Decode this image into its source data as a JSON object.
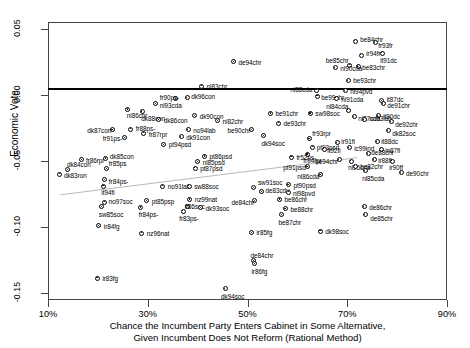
{
  "chart_data": {
    "type": "scatter",
    "title": "",
    "xlabel": "Chance the Incumbent Party Enters Cabinet in Some Alternative, Given Incumbent Does Not Reform (Rational Method)",
    "xlabel_line1": "Chance the Incumbent Party Enters Cabinet in Some Alternative,",
    "xlabel_line2": "Given Incumbent Does Not Reform (Rational Method)",
    "ylabel": "Economic Vote",
    "xlim": [
      10,
      90
    ],
    "ylim": [
      -0.155,
      0.055
    ],
    "xticks": [
      "10%",
      "30%",
      "50%",
      "70%",
      "90%"
    ],
    "xtick_values": [
      10,
      30,
      50,
      70,
      90
    ],
    "yticks": [
      "0.05",
      "0.00",
      "-0.05",
      "-0.10",
      "-0.15"
    ],
    "ytick_values": [
      0.05,
      0.0,
      -0.05,
      -0.1,
      -0.15
    ],
    "grid": false,
    "legend": false,
    "zero_line": 0.0,
    "trend_line": {
      "x0": 12.5,
      "y0": -0.0755,
      "x1": 72.0,
      "y1": -0.0475
    },
    "points": [
      {
        "label": "be84chr",
        "x": 71.6,
        "y": 0.0405,
        "lx": 5,
        "ly": -2
      },
      {
        "label": "fr93fr",
        "x": 75.6,
        "y": 0.0395,
        "lx": 3,
        "ly": 2
      },
      {
        "label": "ir94fr",
        "x": 72.8,
        "y": 0.03,
        "lx": 5,
        "ly": -2
      },
      {
        "label": "it91dc",
        "x": 77.0,
        "y": 0.0315,
        "lx": -2,
        "ly": 7
      },
      {
        "label": "be85chr",
        "x": 70.5,
        "y": 0.0225,
        "lx": -24,
        "ly": -5
      },
      {
        "label": "be83chr",
        "x": 72.2,
        "y": 0.0215,
        "lx": 4,
        "ly": 1
      },
      {
        "label": "nl90cda",
        "x": 67.6,
        "y": 0.0205,
        "lx": 5,
        "ly": 0
      },
      {
        "label": "de94chr",
        "x": 47.2,
        "y": 0.025,
        "lx": 5,
        "ly": 0
      },
      {
        "label": "be93chr",
        "x": 70.2,
        "y": 0.0105,
        "lx": 5,
        "ly": -1
      },
      {
        "label": "nl94pvd",
        "x": 69.6,
        "y": 0.003,
        "lx": 5,
        "ly": 0
      },
      {
        "label": "nl88cda",
        "x": 63.8,
        "y": 0.0035,
        "lx": -26,
        "ly": -1
      },
      {
        "label": "nl83chr",
        "x": 40.8,
        "y": 0.0065,
        "lx": 5,
        "ly": 0
      },
      {
        "label": "be99chr",
        "x": 64.0,
        "y": -0.001,
        "lx": 4,
        "ly": 1
      },
      {
        "label": "nl91cda",
        "x": 67.8,
        "y": -0.0025,
        "lx": 5,
        "ly": 1
      },
      {
        "label": "it87dc",
        "x": 76.9,
        "y": -0.0045,
        "lx": 5,
        "ly": -2
      },
      {
        "label": "de91chr",
        "x": 77.2,
        "y": -0.0065,
        "lx": 4,
        "ly": 2
      },
      {
        "label": "dk96con",
        "x": 37.9,
        "y": -0.002,
        "lx": 4,
        "ly": -1
      },
      {
        "label": "fr90ps-",
        "x": 35.6,
        "y": -0.003,
        "lx": -16,
        "ly": -2
      },
      {
        "label": "nl93cda",
        "x": 31.6,
        "y": -0.0065,
        "lx": 4,
        "ly": 2
      },
      {
        "label": "nl84cda",
        "x": 70.2,
        "y": -0.0115,
        "lx": -22,
        "ly": -4
      },
      {
        "label": "nl87cda",
        "x": 71.4,
        "y": -0.0165,
        "lx": 4,
        "ly": 1
      },
      {
        "label": "it90dc",
        "x": 76.2,
        "y": -0.016,
        "lx": 5,
        "ly": 0
      },
      {
        "label": "nl86chr",
        "x": 26.0,
        "y": -0.011,
        "lx": -1,
        "ly": 6
      },
      {
        "label": "dk88con",
        "x": 28.9,
        "y": -0.0125,
        "lx": -1,
        "ly": 7
      },
      {
        "label": "dk90con",
        "x": 39.4,
        "y": -0.016,
        "lx": 5,
        "ly": 0
      },
      {
        "label": "dk86con",
        "x": 32.2,
        "y": -0.019,
        "lx": 5,
        "ly": 0
      },
      {
        "label": "nl82chr",
        "x": 44.0,
        "y": -0.0195,
        "lx": 5,
        "ly": 0
      },
      {
        "label": "be91chr",
        "x": 54.6,
        "y": -0.014,
        "lx": 5,
        "ly": 0
      },
      {
        "label": "sw98soc",
        "x": 62.6,
        "y": -0.014,
        "lx": 5,
        "ly": 0
      },
      {
        "label": "de93chr",
        "x": 56.2,
        "y": -0.0215,
        "lx": 5,
        "ly": 0
      },
      {
        "label": "no93lab",
        "x": 73.4,
        "y": -0.019,
        "lx": 5,
        "ly": -2
      },
      {
        "label": "de92chr",
        "x": 78.8,
        "y": -0.0205,
        "lx": 4,
        "ly": 2
      },
      {
        "label": "dk87con",
        "x": 22.9,
        "y": -0.0265,
        "lx": -25,
        "ly": 0
      },
      {
        "label": "fr88ps-",
        "x": 26.6,
        "y": -0.026,
        "lx": 5,
        "ly": -1
      },
      {
        "label": "fr87rpr",
        "x": 29.2,
        "y": -0.029,
        "lx": 5,
        "ly": 1
      },
      {
        "label": "no94lab",
        "x": 38.1,
        "y": -0.0265,
        "lx": 5,
        "ly": 0
      },
      {
        "label": "be90chr",
        "x": 50.8,
        "y": -0.0265,
        "lx": -24,
        "ly": 0
      },
      {
        "label": "dk82soc",
        "x": 78.2,
        "y": -0.027,
        "lx": 4,
        "ly": 2
      },
      {
        "label": "fr91ps-",
        "x": 25.4,
        "y": -0.0325,
        "lx": -22,
        "ly": 0
      },
      {
        "label": "dk91con",
        "x": 36.7,
        "y": -0.0315,
        "lx": 5,
        "ly": 0
      },
      {
        "label": "dk94soc",
        "x": 53.2,
        "y": -0.031,
        "lx": -2,
        "ly": 7
      },
      {
        "label": "pt94psd",
        "x": 33.2,
        "y": -0.0375,
        "lx": 5,
        "ly": 0
      },
      {
        "label": "fr93rpr",
        "x": 62.4,
        "y": -0.033,
        "lx": 3,
        "ly": -5
      },
      {
        "label": "pt93psrl",
        "x": 63.1,
        "y": -0.0395,
        "lx": 4,
        "ly": 0
      },
      {
        "label": "it92fi",
        "x": 65.4,
        "y": -0.041,
        "lx": 3,
        "ly": 1
      },
      {
        "label": "ic99ind",
        "x": 70.4,
        "y": -0.04,
        "lx": 5,
        "ly": 0
      },
      {
        "label": "ir91fi",
        "x": 68.0,
        "y": -0.036,
        "lx": 4,
        "ly": -1
      },
      {
        "label": "it88dc",
        "x": 76.0,
        "y": -0.0355,
        "lx": 4,
        "ly": -1
      },
      {
        "label": "in87fl",
        "x": 76.8,
        "y": -0.041,
        "lx": 4,
        "ly": 1
      },
      {
        "label": "fr94rpr",
        "x": 62.0,
        "y": -0.045,
        "lx": -4,
        "ly": 6
      },
      {
        "label": "pt86psd",
        "x": 41.4,
        "y": -0.0465,
        "lx": 5,
        "ly": 0
      },
      {
        "label": "fr52ps-",
        "x": 58.8,
        "y": -0.047,
        "lx": 5,
        "ly": 0
      },
      {
        "label": "de88chr",
        "x": 74.2,
        "y": -0.0445,
        "lx": 3,
        "ly": -2
      },
      {
        "label": "fr86rpr",
        "x": 16.8,
        "y": -0.049,
        "lx": 4,
        "ly": 0
      },
      {
        "label": "dk85con",
        "x": 21.6,
        "y": -0.048,
        "lx": 4,
        "ly": -2
      },
      {
        "label": "nl85psd",
        "x": 40.0,
        "y": -0.0505,
        "lx": 5,
        "ly": 0
      },
      {
        "label": "be94chr",
        "x": 68.4,
        "y": -0.049,
        "lx": -24,
        "ly": 1
      },
      {
        "label": "ir88fl",
        "x": 75.4,
        "y": -0.049,
        "lx": 4,
        "ly": 0
      },
      {
        "label": "nl95cda",
        "x": 70.8,
        "y": -0.05,
        "lx": -3,
        "ly": 6
      },
      {
        "label": "ir90ff",
        "x": 79.0,
        "y": -0.05,
        "lx": -3,
        "ly": 6
      },
      {
        "label": "pt87psd",
        "x": 39.5,
        "y": -0.0555,
        "lx": 5,
        "ly": 0
      },
      {
        "label": "be82chr",
        "x": 71.6,
        "y": -0.054,
        "lx": 5,
        "ly": 0
      },
      {
        "label": "pt91psd",
        "x": 62.0,
        "y": -0.0545,
        "lx": -24,
        "ly": 0
      },
      {
        "label": "dk84con",
        "x": 14.0,
        "y": -0.0565,
        "lx": -1,
        "ly": -6
      },
      {
        "label": "fr85ps",
        "x": 21.8,
        "y": -0.056,
        "lx": 2,
        "ly": -6
      },
      {
        "label": "nl86cda",
        "x": 64.6,
        "y": -0.0605,
        "lx": -23,
        "ly": 1
      },
      {
        "label": "de90chr",
        "x": 80.8,
        "y": -0.059,
        "lx": 5,
        "ly": 0
      },
      {
        "label": "nl85cda",
        "x": 73.6,
        "y": -0.0575,
        "lx": -3,
        "ly": 7
      },
      {
        "label": "dk83ron",
        "x": 12.4,
        "y": -0.06,
        "lx": 4,
        "ly": 1
      },
      {
        "label": "fr84ps-",
        "x": 21.4,
        "y": -0.064,
        "lx": 4,
        "ly": 1
      },
      {
        "label": "it94fi",
        "x": 21.1,
        "y": -0.069,
        "lx": -2,
        "ly": 6
      },
      {
        "label": "no91lab",
        "x": 33.0,
        "y": -0.069,
        "lx": 5,
        "ly": 0
      },
      {
        "label": "sw88soc",
        "x": 38.3,
        "y": -0.069,
        "lx": 5,
        "ly": 0
      },
      {
        "label": "sw91soc",
        "x": 51.3,
        "y": -0.07,
        "lx": 4,
        "ly": -5
      },
      {
        "label": "pt90psd",
        "x": 58.2,
        "y": -0.068,
        "lx": 5,
        "ly": 0
      },
      {
        "label": "de83cdu",
        "x": 52.8,
        "y": -0.073,
        "lx": 4,
        "ly": -1
      },
      {
        "label": "nl98pvd",
        "x": 58.3,
        "y": -0.0735,
        "lx": 4,
        "ly": 1
      },
      {
        "label": "no97soc",
        "x": 21.4,
        "y": -0.081,
        "lx": 4,
        "ly": -1
      },
      {
        "label": "pt85psp",
        "x": 29.8,
        "y": -0.08,
        "lx": 5,
        "ly": 0
      },
      {
        "label": "nz99nat",
        "x": 38.4,
        "y": -0.079,
        "lx": 5,
        "ly": 0
      },
      {
        "label": "de84chr",
        "x": 51.4,
        "y": -0.08,
        "lx": -23,
        "ly": 1
      },
      {
        "label": "be86chr",
        "x": 56.4,
        "y": -0.079,
        "lx": 5,
        "ly": 0
      },
      {
        "label": "it86soc",
        "x": 38.0,
        "y": -0.084,
        "lx": -3,
        "ly": 0
      },
      {
        "label": "dk93soc",
        "x": 40.6,
        "y": -0.0855,
        "lx": 5,
        "ly": 0
      },
      {
        "label": "sw85soc",
        "x": 20.8,
        "y": -0.0845,
        "lx": -3,
        "ly": 7
      },
      {
        "label": "fr84ps-",
        "x": 28.6,
        "y": -0.085,
        "lx": -2,
        "ly": 7
      },
      {
        "label": "fr83ps-",
        "x": 37.1,
        "y": -0.088,
        "lx": -4,
        "ly": 7
      },
      {
        "label": "be88chr",
        "x": 57.6,
        "y": -0.086,
        "lx": 5,
        "ly": 0
      },
      {
        "label": "de86chr",
        "x": 73.4,
        "y": -0.0845,
        "lx": 5,
        "ly": 0
      },
      {
        "label": "de85chr",
        "x": 73.6,
        "y": -0.0905,
        "lx": 5,
        "ly": 3
      },
      {
        "label": "be87chr",
        "x": 56.8,
        "y": -0.0905,
        "lx": -3,
        "ly": 7
      },
      {
        "label": "ir84fg",
        "x": 20.2,
        "y": -0.099,
        "lx": 5,
        "ly": 0
      },
      {
        "label": "nz96nat",
        "x": 28.8,
        "y": -0.1045,
        "lx": 5,
        "ly": 0
      },
      {
        "label": "ir85fg",
        "x": 50.8,
        "y": -0.104,
        "lx": 5,
        "ly": 0
      },
      {
        "label": "dk98soc",
        "x": 64.6,
        "y": -0.103,
        "lx": 5,
        "ly": 0
      },
      {
        "label": "de84chr2",
        "x": 51.2,
        "y": -0.1255,
        "display": "de84chr",
        "lx": -3,
        "ly": -6
      },
      {
        "label": "ir86fg",
        "x": 51.4,
        "y": -0.1275,
        "lx": -3,
        "ly": 7
      },
      {
        "label": "ir83fg",
        "x": 19.9,
        "y": -0.1385,
        "lx": 5,
        "ly": 0
      },
      {
        "label": "dk94soc",
        "x": 45.5,
        "y": -0.1465,
        "lx": -4,
        "ly": 7
      }
    ]
  }
}
